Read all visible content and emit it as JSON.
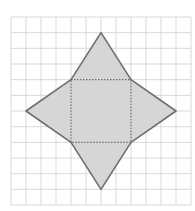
{
  "diagram": {
    "type": "grid-geometry-net",
    "grid": {
      "columns": 12,
      "rows": 12,
      "origin_px": [
        11,
        17
      ],
      "cell_w_px": 15,
      "cell_h_px": 15.67,
      "line_color": "#cfcfcf"
    },
    "square_grid_coords": {
      "x0": 4,
      "y0": 4,
      "x1": 8,
      "y1": 8
    },
    "triangle_apexes_grid_coords": {
      "top": [
        6,
        1
      ],
      "right": [
        11,
        6
      ],
      "bottom": [
        6,
        11
      ],
      "left": [
        1,
        6
      ]
    },
    "colors": {
      "fill": "#d6d6d6",
      "outline": "#6e6e6e",
      "dotted": "#6e6e6e",
      "background": "#ffffff"
    }
  }
}
